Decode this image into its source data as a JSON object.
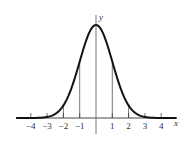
{
  "chart_data": {
    "type": "line",
    "title": "",
    "xlabel": "x",
    "ylabel": "y",
    "x_ticks": [
      -4,
      -3,
      -2,
      -1,
      1,
      2,
      3,
      4
    ],
    "x_tick_labels": [
      "−4",
      "−3",
      "−2",
      "−1",
      "1",
      "2",
      "3",
      "4"
    ],
    "xlim": [
      -4.9,
      5
    ],
    "curve": "bell curve y = e^(-x^2/2) (normal distribution shape)",
    "vertical_lines_at": [
      -2,
      -1,
      0,
      1,
      2
    ],
    "grid": false,
    "legend": null
  }
}
